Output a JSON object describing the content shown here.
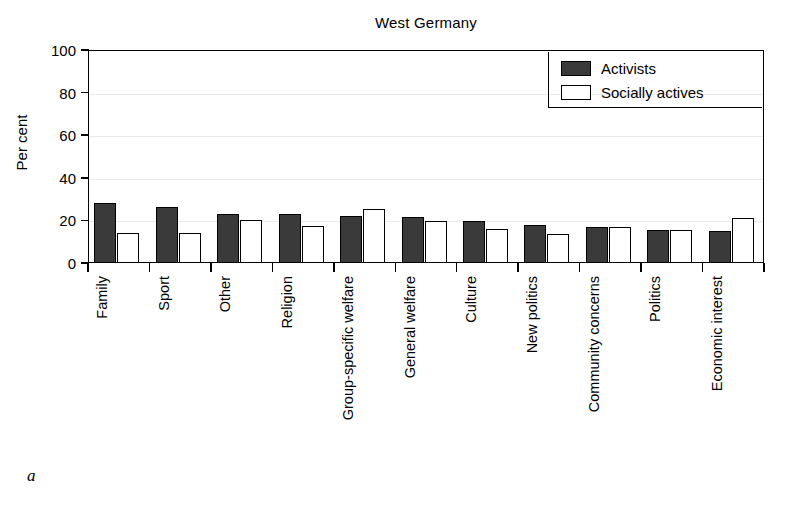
{
  "figure": {
    "panel_letter": "a"
  },
  "chart_data": {
    "type": "bar",
    "title": "West Germany",
    "xlabel": "",
    "ylabel": "Per cent",
    "ylim": [
      0,
      100
    ],
    "yticks": [
      0,
      20,
      40,
      60,
      80,
      100
    ],
    "ytick_labels": [
      "0",
      "20",
      "40",
      "60",
      "80",
      "100"
    ],
    "grid": true,
    "legend_position": "top-right",
    "categories": [
      "Family",
      "Sport",
      "Other",
      "Religion",
      "Group-specific welfare",
      "General welfare",
      "Culture",
      "New politics",
      "Community concerns",
      "Politics",
      "Economic interest"
    ],
    "series": [
      {
        "name": "Activists",
        "color": "#3a3a3a",
        "values": [
          28,
          26.5,
          23,
          23,
          22,
          21.5,
          19.5,
          18,
          17,
          15.5,
          15
        ]
      },
      {
        "name": "Socially actives",
        "color": "#ffffff",
        "values": [
          14,
          14,
          20,
          17.5,
          25.5,
          19.5,
          16,
          13.5,
          17,
          15.5,
          21
        ]
      }
    ]
  }
}
